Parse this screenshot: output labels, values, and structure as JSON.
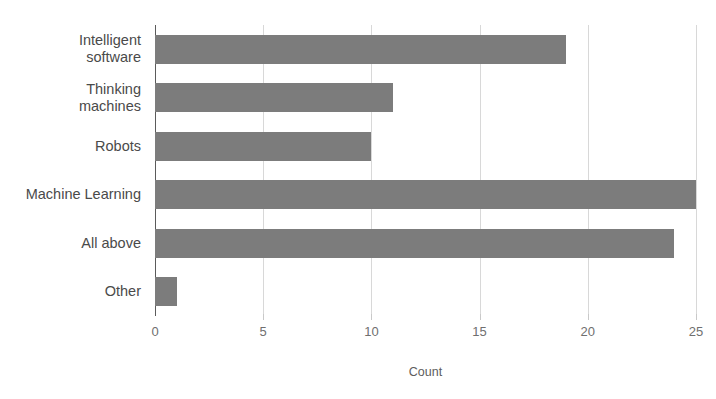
{
  "chart_data": {
    "type": "bar",
    "orientation": "horizontal",
    "title": "",
    "subtitle": "",
    "xlabel": "Count",
    "ylabel": "",
    "categories": [
      "Intelligent software",
      "Thinking machines",
      "Robots",
      "Machine Learning",
      "All above",
      "Other"
    ],
    "category_lines": [
      [
        "Intelligent",
        "software"
      ],
      [
        "Thinking",
        "machines"
      ],
      [
        "Robots"
      ],
      [
        "Machine Learning"
      ],
      [
        "All above"
      ],
      [
        "Other"
      ]
    ],
    "values": [
      19,
      11,
      10,
      25,
      24,
      1
    ],
    "xlim": [
      0,
      25
    ],
    "xticks": [
      0,
      5,
      10,
      15,
      20,
      25
    ],
    "xtick_labels": [
      "0",
      "5",
      "10",
      "15",
      "20",
      "25"
    ],
    "grid": true,
    "grid_axis": "x",
    "legend": null,
    "bar_color": "#7c7c7c",
    "grid_color": "#d8d8d8",
    "axis_color": "#5b5b5b",
    "background": "#ffffff"
  },
  "axis": {
    "x_title": "Count"
  }
}
